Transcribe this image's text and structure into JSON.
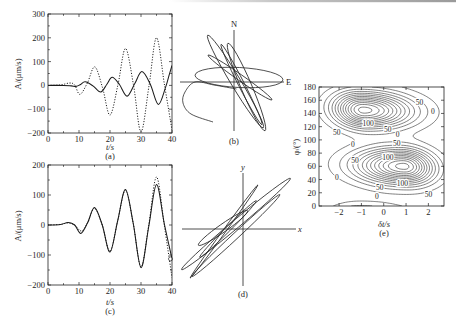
{
  "chart_data": [
    {
      "id": "a",
      "type": "line",
      "label": "(a)",
      "title": "",
      "xlabel": "t/s",
      "ylabel": "A/(μm/s)",
      "xlim": [
        0,
        40
      ],
      "ylim": [
        -200,
        300
      ],
      "xticks": [
        0,
        10,
        20,
        30,
        40
      ],
      "x_tick_labels": [
        "0",
        "10",
        "20",
        "30",
        "40"
      ],
      "yticks": [
        -200,
        -100,
        0,
        100,
        200,
        300
      ],
      "y_tick_labels": [
        "−200",
        "−100",
        "0",
        "100",
        "200",
        "300"
      ],
      "x_minor_step": 5,
      "y_minor_step": 50,
      "grid": false,
      "legend": null,
      "series": [
        {
          "name": "solid",
          "style": "solid",
          "points": [
            [
              0,
              0
            ],
            [
              5,
              0
            ],
            [
              7.5,
              -2
            ],
            [
              9.2,
              -4
            ],
            [
              10.5,
              4
            ],
            [
              12,
              15
            ],
            [
              14.5,
              -2
            ],
            [
              17,
              -28
            ],
            [
              19,
              5
            ],
            [
              20.7,
              34
            ],
            [
              23,
              5
            ],
            [
              25.5,
              -45
            ],
            [
              28,
              8
            ],
            [
              30.3,
              58
            ],
            [
              33,
              5
            ],
            [
              35.6,
              -80
            ],
            [
              38,
              -5
            ],
            [
              39,
              40
            ],
            [
              40,
              84
            ]
          ]
        },
        {
          "name": "dotted",
          "style": "dotted",
          "points": [
            [
              0,
              0
            ],
            [
              4,
              2
            ],
            [
              7,
              10
            ],
            [
              8.6,
              2
            ],
            [
              10.3,
              -38
            ],
            [
              12.7,
              10
            ],
            [
              15.1,
              78
            ],
            [
              17.6,
              -10
            ],
            [
              20,
              -125
            ],
            [
              22.6,
              5
            ],
            [
              25,
              155
            ],
            [
              27.6,
              0
            ],
            [
              30,
              -195
            ],
            [
              32.6,
              0
            ],
            [
              35,
              200
            ],
            [
              37.6,
              0
            ],
            [
              40,
              -187
            ]
          ]
        }
      ]
    },
    {
      "id": "b",
      "type": "particle_motion",
      "label": "(b)",
      "axes": {
        "north_label": "N",
        "east_label": "E"
      },
      "units_note": "normalized displacement, axis half-length = 1",
      "loops": [
        {
          "cx": 0.1,
          "cy": 0.09,
          "rx": 0.88,
          "ry": 0.2,
          "rot": -3
        },
        {
          "cx": 0.03,
          "cy": 0.01,
          "rx": 1.08,
          "ry": 0.1,
          "rot": -59
        },
        {
          "cx": 0.25,
          "cy": -0.1,
          "rx": 0.95,
          "ry": 0.11,
          "rot": -67
        },
        {
          "cx": 0.15,
          "cy": -0.05,
          "rx": 0.9,
          "ry": 0.06,
          "rot": -63
        },
        {
          "cx": 0.12,
          "cy": 0.09,
          "rx": 0.78,
          "ry": 0.06,
          "rot": -35
        }
      ],
      "tail": [
        [
          0.05,
          -0.14
        ],
        [
          -0.4,
          -0.06
        ],
        [
          -0.78,
          0.0
        ],
        [
          -0.98,
          -0.2
        ],
        [
          -1.02,
          -0.42
        ],
        [
          -0.86,
          -0.64
        ],
        [
          -0.42,
          -0.8
        ]
      ]
    },
    {
      "id": "c",
      "type": "line",
      "label": "(c)",
      "title": "",
      "xlabel": "t/s",
      "ylabel": "A/(μm/s)",
      "xlim": [
        0,
        40
      ],
      "ylim": [
        -200,
        200
      ],
      "xticks": [
        0,
        10,
        20,
        30,
        40
      ],
      "x_tick_labels": [
        "0",
        "10",
        "20",
        "30",
        "40"
      ],
      "yticks": [
        -200,
        -100,
        0,
        100,
        200
      ],
      "y_tick_labels": [
        "−200",
        "−100",
        "0",
        "100",
        "200"
      ],
      "x_minor_step": 5,
      "y_minor_step": 50,
      "grid": false,
      "legend": null,
      "series": [
        {
          "name": "solid",
          "style": "solid",
          "points": [
            [
              0,
              0
            ],
            [
              4,
              2
            ],
            [
              6.5,
              8
            ],
            [
              8.6,
              0
            ],
            [
              10.6,
              -28
            ],
            [
              12.8,
              8
            ],
            [
              15,
              58
            ],
            [
              17.5,
              0
            ],
            [
              20,
              -90
            ],
            [
              22.5,
              15
            ],
            [
              25,
              118
            ],
            [
              27.5,
              5
            ],
            [
              30,
              -142
            ],
            [
              32.5,
              -5
            ],
            [
              35,
              135
            ],
            [
              37.5,
              5
            ],
            [
              40,
              -113
            ]
          ]
        },
        {
          "name": "dotted",
          "style": "dotted",
          "points": [
            [
              0,
              0
            ],
            [
              4,
              2
            ],
            [
              6.5,
              7
            ],
            [
              8.6,
              0
            ],
            [
              10.8,
              -20
            ],
            [
              12.9,
              10
            ],
            [
              15,
              56
            ],
            [
              17.5,
              0
            ],
            [
              20,
              -88
            ],
            [
              22.5,
              15
            ],
            [
              25,
              116
            ],
            [
              27.5,
              5
            ],
            [
              30,
              -140
            ],
            [
              32.5,
              0
            ],
            [
              35,
              160
            ],
            [
              37.5,
              0
            ],
            [
              40,
              -175
            ]
          ]
        }
      ],
      "markers": [
        {
          "x": 40,
          "y": -113,
          "shape": "circle"
        }
      ]
    },
    {
      "id": "d",
      "type": "particle_motion",
      "label": "(d)",
      "axes": {
        "y_label": "y",
        "x_label": "x"
      },
      "units_note": "normalized displacement, axis half-length = 1",
      "loops": [
        {
          "cx": -0.14,
          "cy": 0.1,
          "rx": 1.42,
          "ry": 0.08,
          "rot": 40
        },
        {
          "cx": -0.38,
          "cy": -0.05,
          "rx": 1.15,
          "ry": 0.03,
          "rot": 54
        },
        {
          "cx": -0.14,
          "cy": -0.13,
          "rx": 1.2,
          "ry": 0.06,
          "rot": 43
        },
        {
          "cx": -0.4,
          "cy": 0.02,
          "rx": 0.6,
          "ry": 0.08,
          "rot": 35
        },
        {
          "cx": -0.3,
          "cy": 0.0,
          "rx": 0.8,
          "ry": 0.05,
          "rot": 45
        }
      ],
      "tail": []
    },
    {
      "id": "e",
      "type": "contour",
      "label": "(e)",
      "xlabel": "δt/s",
      "ylabel": "φ/(°)",
      "xlim": [
        -2.9,
        2.7
      ],
      "ylim": [
        0,
        180
      ],
      "xticks": [
        -2,
        -1,
        0,
        1,
        2
      ],
      "x_tick_labels": [
        "−2",
        "−1",
        "0",
        "1",
        "2"
      ],
      "yticks": [
        0,
        20,
        40,
        60,
        80,
        100,
        120,
        140,
        160,
        180
      ],
      "y_tick_labels": [
        "0",
        "20",
        "40",
        "60",
        "80",
        "100",
        "120",
        "140",
        "160",
        "180"
      ],
      "grid": false,
      "maxima": [
        {
          "x": -0.9,
          "phi": 145
        },
        {
          "x": 0.9,
          "phi": 60
        }
      ],
      "labeled_levels": [
        0,
        50,
        100
      ],
      "contour_labels": [
        {
          "x": 1.6,
          "phi": 157,
          "text": "50"
        },
        {
          "x": 2.2,
          "phi": 143,
          "text": "0"
        },
        {
          "x": -0.7,
          "phi": 125,
          "text": "100"
        },
        {
          "x": 0.18,
          "phi": 116,
          "text": "50"
        },
        {
          "x": 0.62,
          "phi": 108,
          "text": "0"
        },
        {
          "x": -2.1,
          "phi": 111,
          "text": "50"
        },
        {
          "x": -1.38,
          "phi": 93,
          "text": "0"
        },
        {
          "x": 0.58,
          "phi": 95,
          "text": "50"
        },
        {
          "x": -1.29,
          "phi": 69,
          "text": "50"
        },
        {
          "x": 0.18,
          "phi": 73,
          "text": "100"
        },
        {
          "x": -2.1,
          "phi": 43,
          "text": "0"
        },
        {
          "x": 0.84,
          "phi": 34,
          "text": "100"
        },
        {
          "x": -0.18,
          "phi": 27.5,
          "text": "50"
        },
        {
          "x": -0.31,
          "phi": 14,
          "text": "0"
        },
        {
          "x": 2.0,
          "phi": 18,
          "text": "50"
        }
      ]
    }
  ]
}
